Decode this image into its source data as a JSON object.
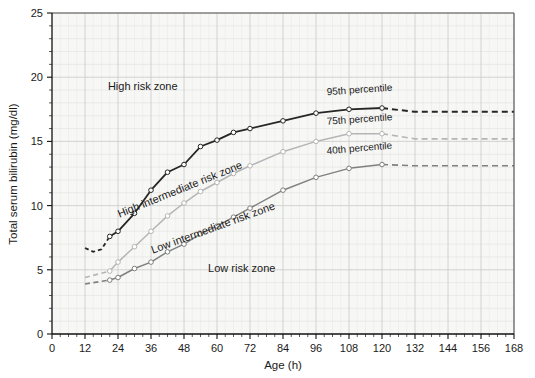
{
  "chart_data": {
    "type": "line",
    "title": "",
    "xlabel": "Age (h)",
    "ylabel": "Total serum bilirubin (mg/dl)",
    "xlim": [
      0,
      168
    ],
    "ylim": [
      0,
      25
    ],
    "xticks": [
      0,
      12,
      24,
      36,
      48,
      60,
      72,
      84,
      96,
      108,
      120,
      132,
      144,
      156,
      168
    ],
    "yticks": [
      0,
      5,
      10,
      15,
      20,
      25
    ],
    "xtick_labels": [
      "0",
      "12",
      "24",
      "36",
      "48",
      "60",
      "72",
      "84",
      "96",
      "108",
      "120",
      "132",
      "144",
      "156",
      "168"
    ],
    "ytick_labels": [
      "0",
      "5",
      "10",
      "15",
      "20",
      "25"
    ],
    "x_minor_step": 3,
    "y_minor_step": 1,
    "grid": true,
    "legend": "inline-labels",
    "series": [
      {
        "name": "95th percentile",
        "color": "#262626",
        "label": "95th percentile",
        "solid_points": [
          {
            "x": 12,
            "y": 6.7
          },
          {
            "x": 15,
            "y": 6.4
          },
          {
            "x": 18,
            "y": 6.6
          },
          {
            "x": 21,
            "y": 7.6
          },
          {
            "x": 24,
            "y": 8.0
          },
          {
            "x": 30,
            "y": 9.4
          },
          {
            "x": 36,
            "y": 11.2
          },
          {
            "x": 42,
            "y": 12.6
          },
          {
            "x": 48,
            "y": 13.2
          },
          {
            "x": 54,
            "y": 14.6
          },
          {
            "x": 60,
            "y": 15.1
          },
          {
            "x": 66,
            "y": 15.7
          },
          {
            "x": 72,
            "y": 16.0
          },
          {
            "x": 84,
            "y": 16.6
          },
          {
            "x": 96,
            "y": 17.2
          },
          {
            "x": 108,
            "y": 17.5
          },
          {
            "x": 120,
            "y": 17.6
          }
        ],
        "dashed_points": [
          {
            "x": 120,
            "y": 17.6
          },
          {
            "x": 132,
            "y": 17.3
          },
          {
            "x": 168,
            "y": 17.3
          }
        ]
      },
      {
        "name": "75th percentile",
        "color": "#b5b5b5",
        "label": "75th percentile",
        "solid_points": [
          {
            "x": 21,
            "y": 4.9
          },
          {
            "x": 24,
            "y": 5.6
          },
          {
            "x": 30,
            "y": 6.8
          },
          {
            "x": 36,
            "y": 8.0
          },
          {
            "x": 42,
            "y": 9.2
          },
          {
            "x": 48,
            "y": 10.2
          },
          {
            "x": 54,
            "y": 11.1
          },
          {
            "x": 60,
            "y": 11.8
          },
          {
            "x": 66,
            "y": 12.5
          },
          {
            "x": 72,
            "y": 13.1
          },
          {
            "x": 84,
            "y": 14.2
          },
          {
            "x": 96,
            "y": 15.0
          },
          {
            "x": 108,
            "y": 15.6
          },
          {
            "x": 120,
            "y": 15.6
          }
        ],
        "dashed_points": [
          {
            "x": 120,
            "y": 15.6
          },
          {
            "x": 132,
            "y": 15.2
          },
          {
            "x": 168,
            "y": 15.2
          }
        ],
        "lead_dashed_points": [
          {
            "x": 12,
            "y": 4.4
          },
          {
            "x": 21,
            "y": 4.9
          }
        ]
      },
      {
        "name": "40th percentile",
        "color": "#808080",
        "label": "40th percentile",
        "solid_points": [
          {
            "x": 21,
            "y": 4.2
          },
          {
            "x": 24,
            "y": 4.4
          },
          {
            "x": 30,
            "y": 5.1
          },
          {
            "x": 36,
            "y": 5.6
          },
          {
            "x": 42,
            "y": 6.4
          },
          {
            "x": 48,
            "y": 7.0
          },
          {
            "x": 54,
            "y": 7.8
          },
          {
            "x": 60,
            "y": 8.4
          },
          {
            "x": 66,
            "y": 9.1
          },
          {
            "x": 72,
            "y": 9.8
          },
          {
            "x": 84,
            "y": 11.2
          },
          {
            "x": 96,
            "y": 12.2
          },
          {
            "x": 108,
            "y": 12.9
          },
          {
            "x": 120,
            "y": 13.2
          }
        ],
        "dashed_points": [
          {
            "x": 120,
            "y": 13.2
          },
          {
            "x": 132,
            "y": 13.1
          },
          {
            "x": 168,
            "y": 13.1
          }
        ],
        "lead_dashed_points": [
          {
            "x": 12,
            "y": 3.9
          },
          {
            "x": 21,
            "y": 4.2
          }
        ]
      }
    ],
    "zone_annotations": [
      {
        "name": "high-risk-zone",
        "text": "High risk zone",
        "x": 33,
        "y": 19.0,
        "rotation": 0
      },
      {
        "name": "high-intermediate-risk-zone",
        "text": "High intermediate risk zone",
        "x": 47,
        "y": 11.0,
        "rotation": -22
      },
      {
        "name": "low-intermediate-risk-zone",
        "text": "Low intermediate risk zone",
        "x": 59,
        "y": 8.0,
        "rotation": -20
      },
      {
        "name": "low-risk-zone",
        "text": "Low risk zone",
        "x": 69,
        "y": 4.8,
        "rotation": 0
      }
    ],
    "percentile_annotations": [
      {
        "name": "label-95th-percentile",
        "text": "95th percentile",
        "x": 100,
        "y": 18.6,
        "rotation": -4
      },
      {
        "name": "label-75th-percentile",
        "text": "75th percentile",
        "x": 100,
        "y": 16.3,
        "rotation": -4
      },
      {
        "name": "label-40th-percentile",
        "text": "40th percentile",
        "x": 100,
        "y": 14.0,
        "rotation": -5
      }
    ]
  }
}
